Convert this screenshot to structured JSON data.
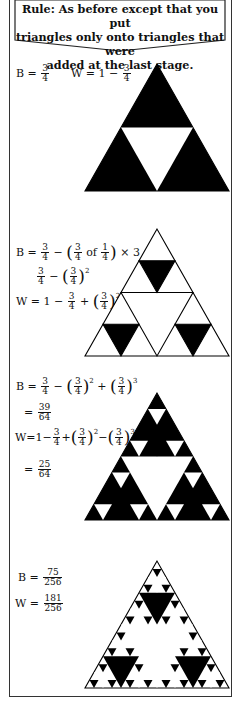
{
  "banner": {
    "lines": [
      "Rule: As before except that you put",
      "triangles only onto triangles that were",
      "added at the last stage."
    ]
  },
  "stages": [
    {
      "depth": 1,
      "B": {
        "label": "B =",
        "value": "3/4"
      },
      "W": {
        "label": "W = 1 −",
        "value": "3/4"
      }
    },
    {
      "depth": 2,
      "B_line1": "B = 3/4 − (3/4 of 1/4) × 3 =",
      "B_line2": "3/4 − (3/4)^2",
      "W_line": "W = 1 − 3/4 + (3/4)^2"
    },
    {
      "depth": 3,
      "B_line1": "B = 3/4 − (3/4)^2 + (3/4)^3",
      "B_result": "39/64",
      "W_line": "W = 1 − 3/4 + (3/4)^2 − (3/4)^3",
      "W_result": "25/64"
    },
    {
      "depth": 4,
      "B": {
        "label": "B =",
        "value": "75/256"
      },
      "W": {
        "label": "W =",
        "value": "181/256"
      }
    }
  ],
  "fractions": {
    "three_quarters": {
      "num": "3",
      "den": "4"
    },
    "one_quarter": {
      "num": "1",
      "den": "4"
    },
    "b3": {
      "num": "39",
      "den": "64"
    },
    "w3": {
      "num": "25",
      "den": "64"
    },
    "b4": {
      "num": "75",
      "den": "256"
    },
    "w4": {
      "num": "181",
      "den": "256"
    }
  },
  "text": {
    "B_eq": "B =",
    "W_eq": "W =",
    "W_one_minus": "W = 1 −",
    "one_minus": "1 −",
    "minus": "−",
    "plus": "+",
    "eq": "=",
    "of": "of",
    "times_three": "× 3 =",
    "lp": "(",
    "rp": ")",
    "sq": "2",
    "cube": "3",
    "W_compact": "W=1−",
    "B_compact_eq": "="
  },
  "colors": {
    "ink": "#000000",
    "paper": "#ffffff",
    "frame": "#333333"
  }
}
